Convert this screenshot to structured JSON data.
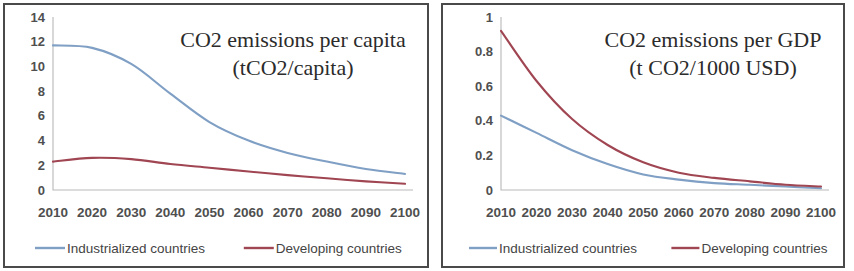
{
  "figure": {
    "panels": [
      "left",
      "right"
    ],
    "background_color": "#ffffff",
    "border_color": "#4a4a4a"
  },
  "colors": {
    "industrialized": "#7f9fc4",
    "developing": "#a04552",
    "axis": "#b9b9b9",
    "tick_text": "#4f4f4f",
    "title_text": "#2b2b2b"
  },
  "left_panel": {
    "title_line1": "CO2 emissions per capita",
    "title_line2": "(tCO2/capita)",
    "legend": [
      {
        "label": "Industrialized countries",
        "color": "#7f9fc4"
      },
      {
        "label": "Developing countries",
        "color": "#a04552"
      }
    ]
  },
  "right_panel": {
    "title_line1": "CO2 emissions per GDP",
    "title_line2": "(t CO2/1000 USD)",
    "legend": [
      {
        "label": "Industrialized countries",
        "color": "#7f9fc4"
      },
      {
        "label": "Developing countries",
        "color": "#a04552"
      }
    ]
  },
  "chart_data": [
    {
      "id": "co2-per-capita",
      "type": "line",
      "title": "CO2 emissions per capita (tCO2/capita)",
      "xlabel": "",
      "ylabel": "",
      "x": [
        2010,
        2020,
        2030,
        2040,
        2050,
        2060,
        2070,
        2080,
        2090,
        2100
      ],
      "categories": [
        "2010",
        "2020",
        "2030",
        "2040",
        "2050",
        "2060",
        "2070",
        "2080",
        "2090",
        "2100"
      ],
      "xlim": [
        2010,
        2100
      ],
      "ylim": [
        0,
        14
      ],
      "yticks": [
        0,
        2,
        4,
        6,
        8,
        10,
        12,
        14
      ],
      "ytick_labels": [
        "0",
        "2",
        "4",
        "6",
        "8",
        "10",
        "12",
        "14"
      ],
      "grid": false,
      "legend_position": "bottom",
      "series": [
        {
          "name": "Industrialized countries",
          "color": "#7f9fc4",
          "values": [
            11.7,
            11.5,
            10.2,
            7.8,
            5.5,
            4.0,
            3.0,
            2.3,
            1.7,
            1.3
          ]
        },
        {
          "name": "Developing countries",
          "color": "#a04552",
          "values": [
            2.3,
            2.6,
            2.5,
            2.1,
            1.8,
            1.5,
            1.2,
            0.95,
            0.7,
            0.5
          ]
        }
      ]
    },
    {
      "id": "co2-per-gdp",
      "type": "line",
      "title": "CO2 emissions per GDP (t CO2/1000 USD)",
      "xlabel": "",
      "ylabel": "",
      "x": [
        2010,
        2020,
        2030,
        2040,
        2050,
        2060,
        2070,
        2080,
        2090,
        2100
      ],
      "categories": [
        "2010",
        "2020",
        "2030",
        "2040",
        "2050",
        "2060",
        "2070",
        "2080",
        "2090",
        "2100"
      ],
      "xlim": [
        2010,
        2100
      ],
      "ylim": [
        0,
        1
      ],
      "yticks": [
        0,
        0.2,
        0.4,
        0.6,
        0.8,
        1
      ],
      "ytick_labels": [
        "0",
        "0.2",
        "0.4",
        "0.6",
        "0.8",
        "1"
      ],
      "grid": false,
      "legend_position": "bottom",
      "series": [
        {
          "name": "Industrialized countries",
          "color": "#7f9fc4",
          "values": [
            0.43,
            0.33,
            0.23,
            0.15,
            0.09,
            0.06,
            0.04,
            0.03,
            0.02,
            0.01
          ]
        },
        {
          "name": "Developing countries",
          "color": "#a04552",
          "values": [
            0.92,
            0.63,
            0.41,
            0.26,
            0.16,
            0.1,
            0.07,
            0.05,
            0.03,
            0.02
          ]
        }
      ]
    }
  ]
}
